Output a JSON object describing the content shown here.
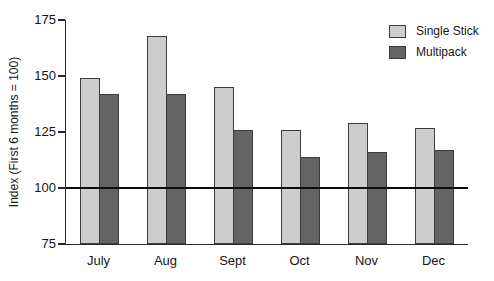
{
  "chart_data": {
    "type": "bar",
    "title": "",
    "categories": [
      "July",
      "Aug",
      "Sept",
      "Oct",
      "Nov",
      "Dec"
    ],
    "series": [
      {
        "name": "Single Stick",
        "color": "#cdcdcd",
        "values": [
          149,
          168,
          145,
          126,
          129,
          127
        ]
      },
      {
        "name": "Multipack",
        "color": "#646464",
        "values": [
          142,
          142,
          126,
          114,
          116,
          117
        ]
      }
    ],
    "xlabel": "",
    "ylabel": "Index (First 6 months = 100)",
    "ylim": [
      75,
      175
    ],
    "yticks": [
      75,
      100,
      125,
      150,
      175
    ],
    "reference_line": 100,
    "grid": false,
    "legend_position": "top-right",
    "bar_border_color": "#3c3c3c",
    "axis_color": "#2a2a2a",
    "reference_line_color": "#0d0d0d",
    "background": "#ffffff"
  }
}
